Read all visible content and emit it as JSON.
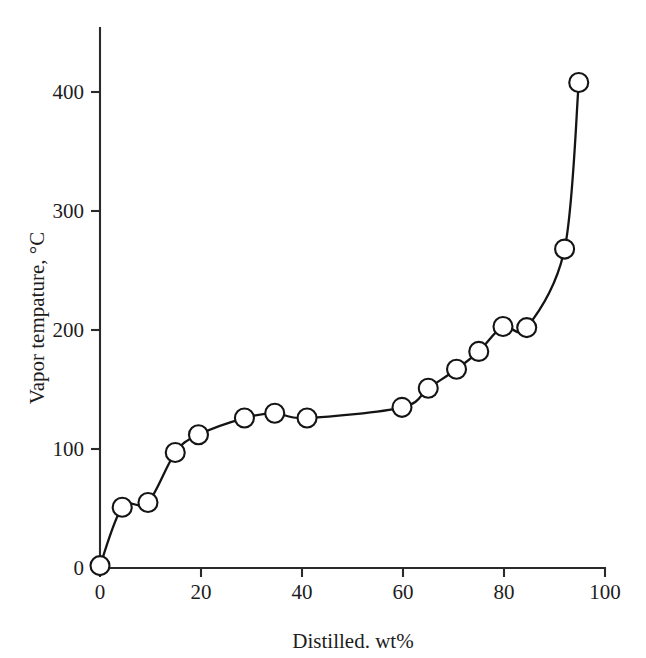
{
  "chart_data": {
    "type": "line",
    "title": "",
    "xlabel": "Distilled. wt%",
    "ylabel": "Vapor tempature, °C",
    "xlim": [
      0,
      100
    ],
    "ylim": [
      0,
      450
    ],
    "xticks": [
      0,
      20,
      40,
      60,
      80,
      100
    ],
    "yticks": [
      0,
      100,
      200,
      300,
      400
    ],
    "xtick_labels": [
      "0",
      "20",
      "40",
      "60",
      "80",
      "100"
    ],
    "ytick_labels": [
      "0",
      "100",
      "200",
      "300",
      "400"
    ],
    "grid": false,
    "legend": false,
    "marker": "open-circle",
    "line_color": "#141414",
    "marker_face_color": "#ffffff",
    "marker_edge_color": "#141414",
    "series": [
      {
        "name": "Distillation curve",
        "x": [
          0,
          4.4,
          9.5,
          14.9,
          19.5,
          28.6,
          34.6,
          41.0,
          59.8,
          65.0,
          70.6,
          75.0,
          79.8,
          84.5,
          92.0,
          94.8
        ],
        "y": [
          2,
          51,
          55,
          97,
          112,
          126,
          130,
          126,
          135,
          151,
          167,
          182,
          203,
          202,
          268,
          408
        ]
      }
    ]
  },
  "axes": {
    "x_axis_name": "x-axis",
    "y_axis_name": "y-axis"
  }
}
